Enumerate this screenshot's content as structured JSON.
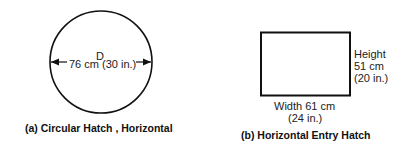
{
  "figure_a": {
    "symbol": "D",
    "dimension": "76 cm (30 in.)",
    "caption": "(a) Circular Hatch , Horizontal"
  },
  "figure_b": {
    "height_label": "Height",
    "height_cm": "51 cm",
    "height_in": "(20 in.)",
    "width_label": "Width 61 cm",
    "width_in": "(24 in.)",
    "caption": "(b) Horizontal Entry Hatch"
  },
  "colors": {
    "line": "#111111",
    "background": "#ffffff"
  }
}
